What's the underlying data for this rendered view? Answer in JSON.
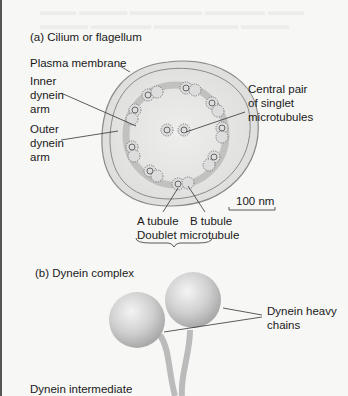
{
  "panel_a": {
    "title": "(a) Cilium or flagellum",
    "labels": {
      "plasma_membrane": "Plasma membrane",
      "inner_dynein_arm": [
        "Inner",
        "dynein",
        "arm"
      ],
      "outer_dynein_arm": [
        "Outer",
        "dynein",
        "arm"
      ],
      "central_pair": [
        "Central pair",
        "of singlet",
        "microtubules"
      ],
      "scale_bar": "100 nm",
      "a_tubule": "A tubule",
      "b_tubule": "B tubule",
      "doublet": "Doublet microtubule"
    }
  },
  "panel_b": {
    "title": "(b) Dynein complex",
    "labels": {
      "heavy_chains": [
        "Dynein heavy",
        "chains"
      ],
      "intermediate": "Dynein intermediate"
    }
  },
  "colors": {
    "background": "#f7f7f5",
    "cell_fill": "#e4e4e2",
    "membrane": "#888888",
    "tubule": "#9a9a9a",
    "sphere": "#c8c8c8",
    "text": "#1a1a1a"
  }
}
